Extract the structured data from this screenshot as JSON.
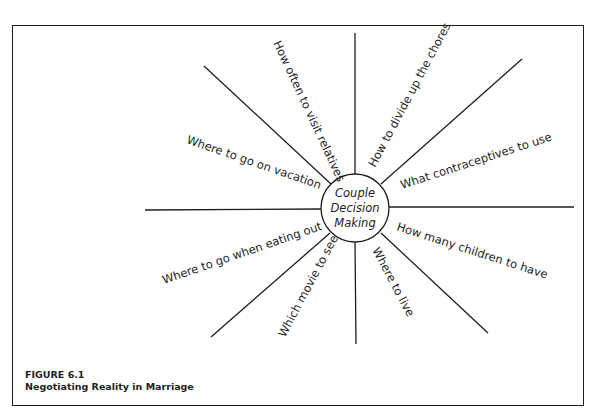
{
  "diagram": {
    "center": {
      "lines": [
        "Couple",
        "Decision",
        "Making"
      ]
    },
    "spokes": [
      {
        "label": "How often to visit relatives"
      },
      {
        "label": "How to divide up the chores"
      },
      {
        "label": "What contraceptives to use"
      },
      {
        "label": "How many children to have"
      },
      {
        "label": "Where to live"
      },
      {
        "label": "Which movie to see"
      },
      {
        "label": "Where to go when eating out"
      },
      {
        "label": "Where to go on vacation"
      }
    ]
  },
  "caption": {
    "figure_number": "FIGURE 6.1",
    "title": "Negotiating Reality in Marriage"
  },
  "colors": {
    "ink": "#1e1e1e",
    "background": "#ffffff"
  }
}
